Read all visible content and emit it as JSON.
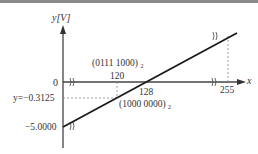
{
  "diagram": {
    "y_axis_label": "y[V]",
    "x_axis_label": "x",
    "y_ticks": {
      "zero": "0",
      "dashed_level": "y=−0.3125",
      "min": "−5.0000"
    },
    "x_ticks": {
      "t120": "120",
      "t128": "128",
      "t255": "255"
    },
    "annotations": {
      "binary_120": "(0111 1000)",
      "binary_120_sub": "2",
      "binary_128": "(1000 0000)",
      "binary_128_sub": "2"
    },
    "line_color": "#1a1a1a",
    "dashed_color": "#777777"
  }
}
